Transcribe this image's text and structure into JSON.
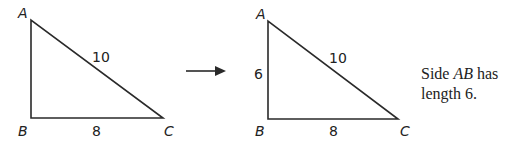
{
  "triangle_left": {
    "vertices": {
      "A": "A",
      "B": "B",
      "C": "C"
    },
    "sides": {
      "AC": "10",
      "BC": "8"
    }
  },
  "arrow": {
    "direction": "right"
  },
  "triangle_right": {
    "vertices": {
      "A": "A",
      "B": "B",
      "C": "C"
    },
    "sides": {
      "AB": "6",
      "AC": "10",
      "BC": "8"
    }
  },
  "caption": {
    "prefix": "Side ",
    "side_name": "AB",
    "line1_suffix": " has",
    "line2": "length 6."
  },
  "colors": {
    "stroke": "#2a2a2a",
    "text": "#222222",
    "background": "#ffffff"
  }
}
